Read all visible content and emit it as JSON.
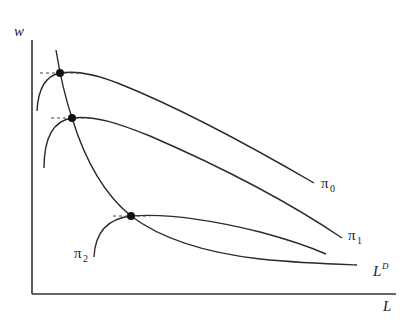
{
  "diagram": {
    "axes": {
      "y_label": "w",
      "x_label": "L"
    },
    "curves": [
      {
        "id": "pi0",
        "label_base": "π",
        "label_sub": "0",
        "kind": "iso-profit"
      },
      {
        "id": "pi1",
        "label_base": "π",
        "label_sub": "1",
        "kind": "iso-profit"
      },
      {
        "id": "pi2",
        "label_base": "π",
        "label_sub": "2",
        "kind": "iso-profit"
      },
      {
        "id": "ld",
        "label_base": "L",
        "label_sup": "D",
        "kind": "labor-demand"
      }
    ],
    "tangency_points": 3,
    "colors": {
      "line": "#2a2a2a",
      "background": "#ffffff"
    }
  }
}
